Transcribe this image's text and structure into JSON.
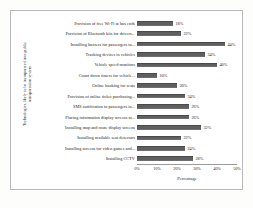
{
  "chart_data": {
    "type": "bar",
    "orientation": "horizontal",
    "title": "",
    "xlabel": "Percentage",
    "ylabel": "Technologies likely to be incorporated into public transportation system",
    "ylabel_line1": "Technologies likely to be incorporated into public",
    "ylabel_line2": "transportation system",
    "xlim": [
      0,
      50
    ],
    "xticks": [
      "0%",
      "10%",
      "20%",
      "30%",
      "40%",
      "50%"
    ],
    "xtick_values": [
      0,
      10,
      20,
      30,
      40,
      50
    ],
    "grid": false,
    "legend": false,
    "bar_color": "#5f5f5f",
    "categories": [
      "Provision of free Wi-Fi at bus ends",
      "Provision of Bluetooth kits for drivers...",
      "Installing buzzers for passengers to...",
      "Tracking devices in vehicles",
      "Vehicle speed monitors",
      "Count down timers for vehicle...",
      "Online booking for seats",
      "Provision of online ticket purchasing...",
      "SMS notification to passengers in...",
      "Placing information display screens at...",
      "Installing map and route display screens",
      "Installing available seat detectors",
      "Installing screens for video games and...",
      "Installing CCTV"
    ],
    "values": [
      18,
      22,
      44,
      34,
      40,
      10,
      20,
      24,
      26,
      26,
      32,
      22,
      24,
      28
    ],
    "value_labels": [
      "18%",
      "22%",
      "44%",
      "34%",
      "40%",
      "10%",
      "20%",
      "24%",
      "26%",
      "26%",
      "32%",
      "22%",
      "24%",
      "28%"
    ]
  }
}
